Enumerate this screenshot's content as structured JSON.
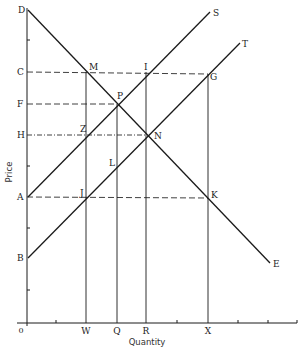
{
  "diagram": {
    "type": "supply-demand",
    "axes": {
      "x_label": "Quantity",
      "y_label": "Price",
      "origin_label": "0"
    },
    "colors": {
      "line": "#1a1a1a",
      "dashed": "#2a2a2a",
      "background": "#ffffff"
    },
    "price_levels": [
      {
        "label": "D",
        "y": 10
      },
      {
        "label": "C",
        "y": 72
      },
      {
        "label": "F",
        "y": 104
      },
      {
        "label": "H",
        "y": 135
      },
      {
        "label": "A",
        "y": 197
      },
      {
        "label": "B",
        "y": 258
      }
    ],
    "quantity_levels": [
      {
        "label": "W",
        "x": 86
      },
      {
        "label": "Q",
        "x": 117
      },
      {
        "label": "R",
        "x": 146
      },
      {
        "label": "X",
        "x": 208
      }
    ],
    "curves": [
      {
        "name": "demand",
        "label": "E",
        "start_label": "D",
        "from": [
          28,
          10
        ],
        "to": [
          270,
          263
        ]
      },
      {
        "name": "supply-S",
        "label": "S",
        "start_label": "A",
        "from": [
          28,
          197
        ],
        "to": [
          210,
          12
        ]
      },
      {
        "name": "supply-T",
        "label": "T",
        "start_label": "B",
        "from": [
          28,
          258
        ],
        "to": [
          240,
          43
        ]
      }
    ],
    "points": [
      {
        "label": "M",
        "x": 86,
        "y": 72
      },
      {
        "label": "I",
        "x": 147,
        "y": 72
      },
      {
        "label": "G",
        "x": 208,
        "y": 74
      },
      {
        "label": "P",
        "x": 117,
        "y": 104
      },
      {
        "label": "Z",
        "x": 86,
        "y": 135
      },
      {
        "label": "N",
        "x": 146,
        "y": 135
      },
      {
        "label": "L",
        "x": 117,
        "y": 167
      },
      {
        "label": "J",
        "x": 86,
        "y": 198
      },
      {
        "label": "K",
        "x": 208,
        "y": 197
      }
    ],
    "labels": {
      "D": "D",
      "C": "C",
      "F": "F",
      "H": "H",
      "A": "A",
      "B": "B",
      "W": "W",
      "Q": "Q",
      "R": "R",
      "X": "X",
      "S": "S",
      "T": "T",
      "E": "E",
      "M": "M",
      "I": "I",
      "G": "G",
      "P": "P",
      "Z": "Z",
      "N": "N",
      "L": "L",
      "J": "J",
      "K": "K"
    }
  }
}
